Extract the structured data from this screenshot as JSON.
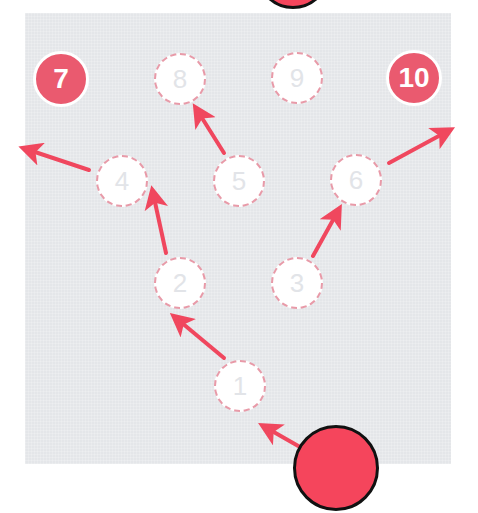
{
  "diagram": {
    "colors": {
      "panel": "#e4e6e9",
      "arrow": "#f0475e",
      "filled_node": "#ea5a6f",
      "empty_node_border": "#e89aa8",
      "ball": "#f5455c"
    },
    "nodes": [
      {
        "label": "1",
        "x": 240,
        "y": 386,
        "state": "empty"
      },
      {
        "label": "2",
        "x": 180,
        "y": 283,
        "state": "empty"
      },
      {
        "label": "3",
        "x": 297,
        "y": 283,
        "state": "empty"
      },
      {
        "label": "4",
        "x": 122,
        "y": 181,
        "state": "empty"
      },
      {
        "label": "5",
        "x": 239,
        "y": 181,
        "state": "empty"
      },
      {
        "label": "6",
        "x": 356,
        "y": 180,
        "state": "empty"
      },
      {
        "label": "7",
        "x": 61,
        "y": 79,
        "state": "filled"
      },
      {
        "label": "8",
        "x": 180,
        "y": 79,
        "state": "empty"
      },
      {
        "label": "9",
        "x": 297,
        "y": 78,
        "state": "empty"
      },
      {
        "label": "10",
        "x": 414,
        "y": 78,
        "state": "filled"
      }
    ],
    "arrows": [
      {
        "from": "ball",
        "x1": 300,
        "y1": 447,
        "x2": 265,
        "y2": 427
      },
      {
        "from": "1",
        "x1": 224,
        "y1": 358,
        "x2": 176,
        "y2": 318
      },
      {
        "from": "2",
        "x1": 166,
        "y1": 253,
        "x2": 153,
        "y2": 193
      },
      {
        "from": "3",
        "x1": 313,
        "y1": 256,
        "x2": 338,
        "y2": 211
      },
      {
        "from": "4",
        "x1": 89,
        "y1": 170,
        "x2": 26,
        "y2": 149
      },
      {
        "from": "5",
        "x1": 224,
        "y1": 153,
        "x2": 197,
        "y2": 110
      },
      {
        "from": "6",
        "x1": 389,
        "y1": 163,
        "x2": 448,
        "y2": 131
      }
    ],
    "balls": [
      {
        "name": "current-ball",
        "x": 336,
        "y": 468,
        "r": 43
      },
      {
        "name": "top-ball",
        "x": 293,
        "y": -28,
        "r": 37
      }
    ]
  }
}
